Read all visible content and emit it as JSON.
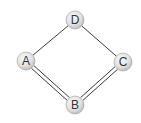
{
  "diagram": {
    "type": "graph",
    "colors": {
      "edge": "#3a3a3a",
      "node_fill_light": "#f4f4f4",
      "node_fill_dark": "#bdbdbd",
      "node_stroke": "#9a9a9a",
      "label": "#333333"
    },
    "nodes": [
      {
        "id": "D",
        "label": "D",
        "x": 75,
        "y": 20
      },
      {
        "id": "A",
        "label": "A",
        "x": 26,
        "y": 61
      },
      {
        "id": "C",
        "label": "C",
        "x": 123,
        "y": 62
      },
      {
        "id": "B",
        "label": "B",
        "x": 75,
        "y": 105
      }
    ],
    "edges": [
      {
        "from": "A",
        "to": "D",
        "type": "single"
      },
      {
        "from": "D",
        "to": "C",
        "type": "single"
      },
      {
        "from": "A",
        "to": "B",
        "type": "double"
      },
      {
        "from": "B",
        "to": "C",
        "type": "double"
      }
    ]
  }
}
